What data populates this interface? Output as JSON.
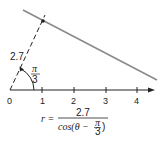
{
  "diagram": {
    "axis_ticks": [
      "0",
      "1",
      "2",
      "3",
      "4"
    ],
    "segment_length_label": "2.7",
    "angle_label": {
      "numerator": "π",
      "denominator": "3"
    },
    "formula": {
      "lhs": "r =",
      "numerator": "2.7",
      "denominator_prefix": "cos(θ −",
      "denominator_frac_num": "π",
      "denominator_frac_den": "3",
      "denominator_suffix": ")"
    },
    "colors": {
      "line": "#8a8a8a",
      "axis": "#222222"
    }
  }
}
